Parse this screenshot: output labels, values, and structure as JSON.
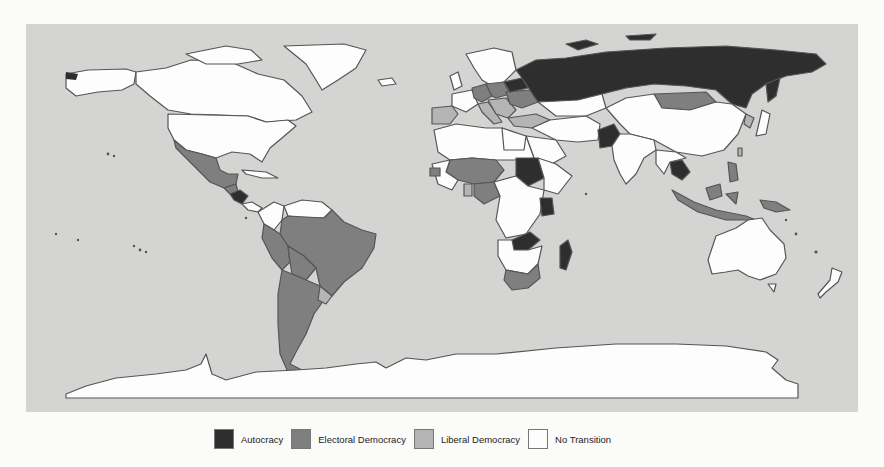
{
  "map": {
    "type": "choropleth-world",
    "background_color": "#d4d4d3",
    "border_color": "#555555",
    "categories": {
      "autocracy": {
        "label": "Autocracy",
        "color": "#2e2e2e"
      },
      "electoral": {
        "label": "Electoral Democracy",
        "color": "#7f7f7f"
      },
      "liberal": {
        "label": "Liberal Democracy",
        "color": "#b4b4b4"
      },
      "none": {
        "label": "No Transition",
        "color": "#fdfdfd"
      }
    },
    "regions": {
      "autocracy": [
        "Russia",
        "Belarus",
        "Kazakhstan (north)",
        "Pakistan",
        "Sudan",
        "Tanzania/Kenya region",
        "Zambia/Malawi region",
        "Madagascar",
        "Thailand/Cambodia",
        "Nicaragua/Honduras"
      ],
      "electoral": [
        "Mexico",
        "Guatemala",
        "Brazil",
        "Peru",
        "Bolivia",
        "Argentina",
        "Chile",
        "Paraguay",
        "Mali",
        "Niger",
        "Nigeria",
        "Senegal",
        "Ghana",
        "South Africa",
        "Ukraine",
        "Germany",
        "Poland",
        "Mongolia",
        "Indonesia",
        "Philippines",
        "Papua New Guinea",
        "Turkey"
      ],
      "liberal": [
        "Spain",
        "Portugal",
        "Greece",
        "Italy",
        "Czech Republic",
        "Uruguay",
        "Taiwan",
        "South Korea"
      ],
      "none": [
        "Canada",
        "United States",
        "Greenland",
        "Alaska",
        "Colombia",
        "Venezuela",
        "China",
        "India",
        "Australia",
        "Antarctica",
        "Algeria",
        "Libya",
        "Egypt",
        "Saudi Arabia",
        "Iran",
        "DR Congo",
        "Angola",
        "Ethiopia",
        "Scandinavia",
        "France"
      ]
    }
  },
  "legend": {
    "items": [
      {
        "key": "autocracy",
        "label": "Autocracy",
        "color": "#2e2e2e"
      },
      {
        "key": "electoral",
        "label": "Electoral Democracy",
        "color": "#7f7f7f"
      },
      {
        "key": "liberal",
        "label": "Liberal Democracy",
        "color": "#b4b4b4"
      },
      {
        "key": "none",
        "label": "No Transition",
        "color": "#fdfdfd"
      }
    ]
  }
}
